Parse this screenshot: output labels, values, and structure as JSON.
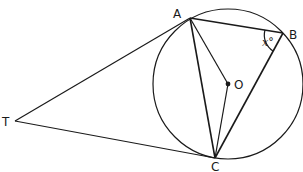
{
  "diagram": {
    "type": "circle-geometry",
    "points": {
      "A": {
        "label": "A",
        "x": 190,
        "y": 18
      },
      "B": {
        "label": "B",
        "x": 283,
        "y": 33
      },
      "C": {
        "label": "C",
        "x": 215,
        "y": 158
      },
      "O": {
        "label": "O",
        "x": 228,
        "y": 84
      },
      "T": {
        "label": "T",
        "x": 15,
        "y": 121
      }
    },
    "circle": {
      "center": "O",
      "radius": 75
    },
    "segments": [
      "TA",
      "TC",
      "AB",
      "BC",
      "AC",
      "AO",
      "OC"
    ],
    "angle_label": "x°",
    "angle_at": "B",
    "stroke_color": "#1a1a1a"
  }
}
